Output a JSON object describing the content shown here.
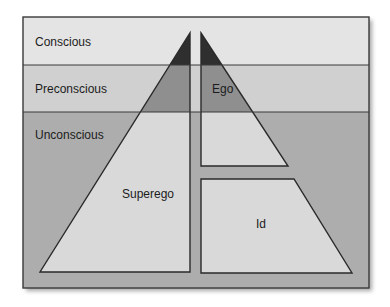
{
  "levels": [
    {
      "label": "Conscious",
      "color": "#e4e4e4"
    },
    {
      "label": "Preconscious",
      "color": "#d0d0d0"
    },
    {
      "label": "Unconscious",
      "color": "#adadad"
    }
  ],
  "structures": [
    {
      "label": "Superego"
    },
    {
      "label": "Ego"
    },
    {
      "label": "Id"
    }
  ],
  "colors": {
    "apex_dark": "#333333",
    "mid_gray": "#8f8f8f",
    "light_fill": "#d9d9d9",
    "stroke": "#2a2a2a"
  }
}
